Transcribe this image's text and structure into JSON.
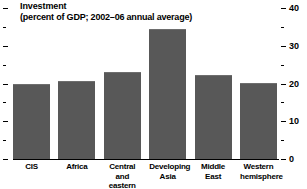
{
  "chart_data": {
    "type": "bar",
    "title": "Investment",
    "subtitle": "(percent of GDP; 2002–06 annual average)",
    "xlabel": "",
    "ylabel": "",
    "ylim": [
      0,
      40
    ],
    "grid": false,
    "legend": false,
    "axis_position": "right",
    "categories": [
      "CIS",
      "Africa",
      "Central and eastern Europe",
      "Developing Asia",
      "Middle East",
      "Western hemisphere"
    ],
    "category_lines": [
      [
        "CIS"
      ],
      [
        "Africa"
      ],
      [
        "Central and",
        "eastern Europe"
      ],
      [
        "Developing",
        "Asia"
      ],
      [
        "Middle",
        "East"
      ],
      [
        "Western",
        "hemisphere"
      ]
    ],
    "values": [
      20.0,
      20.6,
      23.0,
      34.4,
      22.2,
      20.2
    ],
    "tick_labels_major": [
      "0",
      "10",
      "20",
      "30",
      "40"
    ],
    "tick_values_major": [
      0,
      10,
      20,
      30,
      40
    ],
    "tick_values_minor": [
      5,
      15,
      25,
      35
    ],
    "bar_color": "#585858",
    "axis_color": "#000000",
    "background_color": "#ffffff"
  }
}
